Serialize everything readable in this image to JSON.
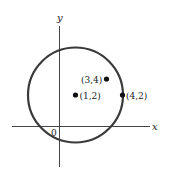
{
  "figure": {
    "axes": {
      "x_label": "x",
      "y_label": "y",
      "origin_label": "0",
      "color": "#444444"
    },
    "circle": {
      "center": [
        1,
        2
      ],
      "passes_through": [
        4,
        2
      ],
      "stroke_color": "#3a3a3a"
    },
    "points": [
      {
        "label": "(1,2)",
        "x": 1,
        "y": 2
      },
      {
        "label": "(3,4)",
        "x": 3,
        "y": 4
      },
      {
        "label": "(4,2)",
        "x": 4,
        "y": 2
      }
    ],
    "point_color": "#111111"
  }
}
